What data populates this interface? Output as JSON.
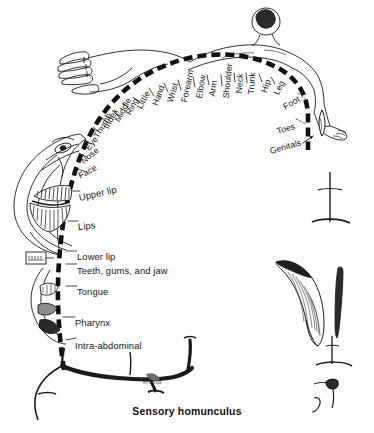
{
  "figure": {
    "caption": "Sensory homunculus",
    "signature": "R.P.L. 1948",
    "ink_color": "#111111",
    "paper_color": "#ffffff"
  },
  "cortex_strip": {
    "name": "postcentral-gyrus-dashed-band",
    "style": "thick black dashed arc"
  },
  "labels": [
    {
      "text": "Little",
      "x": 139,
      "y": 104,
      "rot": -62,
      "size": "small"
    },
    {
      "text": "Ring",
      "x": 128,
      "y": 110,
      "rot": -62,
      "size": "small"
    },
    {
      "text": "Middle",
      "x": 117,
      "y": 117,
      "rot": -62,
      "size": "small"
    },
    {
      "text": "Index",
      "x": 106,
      "y": 124,
      "rot": -62,
      "size": "small"
    },
    {
      "text": "Thumb",
      "x": 96,
      "y": 133,
      "rot": -60,
      "size": "small"
    },
    {
      "text": "Eye",
      "x": 87,
      "y": 145,
      "rot": -52,
      "size": "small"
    },
    {
      "text": "Nose",
      "x": 82,
      "y": 158,
      "rot": -40,
      "size": "small"
    },
    {
      "text": "Face",
      "x": 79,
      "y": 172,
      "rot": -28,
      "size": "small"
    },
    {
      "text": "Upper lip",
      "x": 79,
      "y": 193,
      "rot": -13,
      "size": "big"
    },
    {
      "text": "Lips",
      "x": 78,
      "y": 222,
      "rot": -6,
      "size": "big"
    },
    {
      "text": "Lower lip",
      "x": 77,
      "y": 252,
      "rot": 0,
      "size": "big"
    },
    {
      "text": "Teeth, gums, and jaw",
      "x": 77,
      "y": 266,
      "rot": 0,
      "size": "big"
    },
    {
      "text": "Tongue",
      "x": 77,
      "y": 287,
      "rot": 0,
      "size": "big"
    },
    {
      "text": "Pharynx",
      "x": 75,
      "y": 318,
      "rot": 0,
      "size": "big"
    },
    {
      "text": "Intra-abdominal",
      "x": 75,
      "y": 341,
      "rot": 0,
      "size": "big"
    },
    {
      "text": "Hand",
      "x": 155,
      "y": 101,
      "rot": -70,
      "size": "small"
    },
    {
      "text": "Wrist",
      "x": 170,
      "y": 98,
      "rot": -74,
      "size": "small"
    },
    {
      "text": "Forearm",
      "x": 184,
      "y": 98,
      "rot": -78,
      "size": "small"
    },
    {
      "text": "Elbow",
      "x": 199,
      "y": 94,
      "rot": -80,
      "size": "small"
    },
    {
      "text": "Arm",
      "x": 212,
      "y": 92,
      "rot": -82,
      "size": "small"
    },
    {
      "text": "Shoulder",
      "x": 226,
      "y": 94,
      "rot": -84,
      "size": "small"
    },
    {
      "text": "Neck",
      "x": 239,
      "y": 89,
      "rot": -86,
      "size": "small"
    },
    {
      "text": "Trunk",
      "x": 251,
      "y": 90,
      "rot": -86,
      "size": "small"
    },
    {
      "text": "Hip",
      "x": 264,
      "y": 88,
      "rot": -72,
      "size": "small"
    },
    {
      "text": "Leg",
      "x": 276,
      "y": 90,
      "rot": -64,
      "size": "small"
    },
    {
      "text": "Foot",
      "x": 284,
      "y": 103,
      "rot": -30,
      "size": "small"
    },
    {
      "text": "Toes",
      "x": 277,
      "y": 127,
      "rot": -16,
      "size": "small"
    },
    {
      "text": "Genitals",
      "x": 270,
      "y": 147,
      "rot": -16,
      "size": "small"
    }
  ],
  "body_parts": {
    "head_inset": "distorted-face-with-large-lips",
    "hand_inset": "enlarged-hand-and-fingers",
    "trunk_inset": "small-reclining-trunk-and-head",
    "limb_insets": [
      "arm",
      "leg",
      "foot",
      "genitals"
    ]
  }
}
